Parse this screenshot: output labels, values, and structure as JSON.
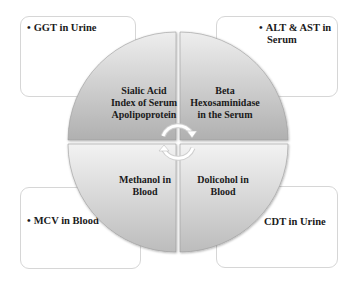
{
  "diagram": {
    "type": "cycle-quadrant",
    "center_quadrants": [
      {
        "position": "top-left",
        "label_lines": [
          "Sialic Acid",
          "Index of Serum",
          "Apolipoprotein"
        ]
      },
      {
        "position": "top-right",
        "label_lines": [
          "Beta",
          "Hexosaminidase",
          "in the Serum"
        ]
      },
      {
        "position": "bottom-left",
        "label_lines": [
          "Methanol in",
          "Blood"
        ]
      },
      {
        "position": "bottom-right",
        "label_lines": [
          "Dolicohol in",
          "Blood"
        ]
      }
    ],
    "outer_boxes": [
      {
        "position": "top-left",
        "bullet": "•",
        "text": "GGT in Urine"
      },
      {
        "position": "top-right",
        "bullet": "•",
        "text_lines": [
          "ALT & AST in",
          "Serum"
        ]
      },
      {
        "position": "bottom-left",
        "bullet": "•",
        "text": "MCV in Blood"
      },
      {
        "position": "bottom-right",
        "text": "CDT in Urine"
      }
    ],
    "center_icon": "circular-arrows-icon",
    "colors": {
      "quadrant_light": "#ececec",
      "quadrant_dark": "#b4b4b4",
      "box_border": "#d6d6d6",
      "text": "#1a1a1a"
    }
  }
}
